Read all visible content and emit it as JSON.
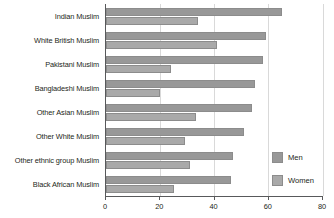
{
  "chart_data": {
    "type": "bar",
    "orientation": "horizontal",
    "title": "",
    "xlabel": "",
    "ylabel": "",
    "xlim": [
      0,
      80
    ],
    "xticks": [
      0,
      20,
      40,
      60,
      80
    ],
    "xticklabels": [
      "0",
      "20",
      "40",
      "60",
      "80"
    ],
    "grid": true,
    "grid_axis": "x",
    "legend_position": "bottom-right",
    "categories": [
      "Indian Muslim",
      "White British Muslim",
      "Pakistani Muslim",
      "Bangladeshi Muslim",
      "Other Asian Muslim",
      "Other White Muslim",
      "Other ethnic group Muslim",
      "Black African Muslim"
    ],
    "series": [
      {
        "name": "Men",
        "color": "#989898",
        "values": [
          65,
          59,
          58,
          55,
          54,
          51,
          47,
          46
        ]
      },
      {
        "name": "Women",
        "color": "#a9a9a9",
        "values": [
          34,
          41,
          24,
          20,
          33,
          29,
          31,
          25
        ]
      }
    ]
  },
  "legend": {
    "items": [
      {
        "label": "Men",
        "swatch": "men"
      },
      {
        "label": "Women",
        "swatch": "women"
      }
    ]
  },
  "colors": {
    "men": "#989898",
    "women": "#a9a9a9",
    "axis": "#58595b",
    "grid": "#d9d9d9",
    "text": "#231f20",
    "background": "#ffffff"
  }
}
